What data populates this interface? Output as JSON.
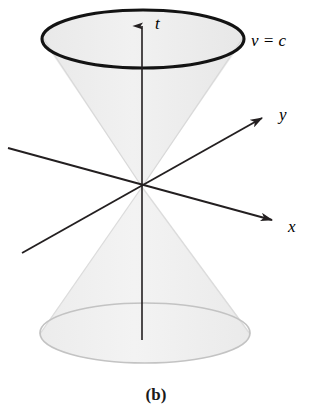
{
  "figure": {
    "caption": "(b)",
    "background_color": "#ffffff"
  },
  "colors": {
    "axis_stroke": "#231f20",
    "cone_fill": "#eeeeee",
    "cone_fill_lower": "#efefef",
    "cone_edge_light": "#d8d8d8",
    "top_ellipse_stroke": "#111111",
    "bottom_ellipse_stroke": "#c2c2c2",
    "text": "#000000"
  },
  "labels": {
    "t_axis": "t",
    "x_axis": "x",
    "y_axis": "y",
    "speed_condition": "v = c"
  },
  "geometry": {
    "origin": {
      "x": 142,
      "y": 187
    },
    "top_ellipse": {
      "cx": 143,
      "cy": 39,
      "rx": 101,
      "ry": 29
    },
    "bottom_ellipse": {
      "cx": 145,
      "cy": 333,
      "rx": 105,
      "ry": 30
    },
    "t_axis": {
      "x1": 142,
      "y1": 340,
      "x2": 142,
      "y2": 16
    },
    "x_axis": {
      "x1": 8,
      "y1": 148,
      "x2": 280,
      "y2": 222
    },
    "y_axis": {
      "x1": 22,
      "y1": 253,
      "x2": 270,
      "y2": 113
    }
  },
  "label_positions": {
    "t": {
      "x": 155,
      "y": 28
    },
    "v_eq_c": {
      "x": 252,
      "y": 45
    },
    "y": {
      "x": 279,
      "y": 118
    },
    "x": {
      "x": 287,
      "y": 230
    },
    "caption": {
      "x": 156,
      "y": 398
    }
  },
  "annotations": {
    "t_label_meaning": "time axis",
    "x_label_meaning": "space axis x",
    "y_label_meaning": "space axis y",
    "v_eq_c_meaning": "surface of the cone traced by light, speed equals c"
  }
}
